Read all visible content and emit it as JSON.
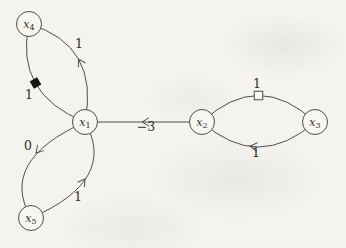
{
  "figure": {
    "background": "#f4f3ee",
    "stroke_color": "#4e4e4e",
    "text_color": "#332f2b",
    "node_fill": "#f7f6f1",
    "diamond_fill": "#181614",
    "node_radius": 12.5,
    "nodes": [
      {
        "name": "x1",
        "base": "x",
        "sub": "1",
        "x": 85,
        "y": 122
      },
      {
        "name": "x2",
        "base": "x",
        "sub": "2",
        "x": 202,
        "y": 122
      },
      {
        "name": "x3",
        "base": "x",
        "sub": "3",
        "x": 315,
        "y": 122
      },
      {
        "name": "x4",
        "base": "x",
        "sub": "4",
        "x": 29,
        "y": 24
      },
      {
        "name": "x5",
        "base": "x",
        "sub": "5",
        "x": 31,
        "y": 218
      }
    ],
    "edges": [
      {
        "name": "x1-to-x4",
        "path": "M 85 122 Q 100 45 29 24",
        "label": "1",
        "label_x": 79,
        "label_y": 48,
        "arrow": {
          "x": 78.5,
          "y": 59,
          "angle": -120
        }
      },
      {
        "name": "x4-to-x1",
        "path": "M 29 24 Q 14 94 85 122",
        "label": "1",
        "label_x": 29,
        "label_y": 99,
        "marker": {
          "type": "filled-diamond",
          "x": 35.5,
          "y": 83,
          "angle": 60
        }
      },
      {
        "name": "x1-to-x5",
        "path": "M 85 122 Q -2 161 31 218",
        "label": "0",
        "label_x": 28,
        "label_y": 150,
        "arrow": {
          "x": 36,
          "y": 153,
          "angle": 132
        }
      },
      {
        "name": "x5-to-x1",
        "path": "M 31 218 Q 118 180 85 122",
        "label": "1",
        "label_x": 78,
        "label_y": 201,
        "arrow": {
          "x": 85,
          "y": 179,
          "angle": -55
        }
      },
      {
        "name": "x2-to-x1",
        "path": "M 202 122 L 85 122",
        "label": "−3",
        "label_x": 146,
        "label_y": 131,
        "arrow": {
          "x": 142,
          "y": 122,
          "angle": 180
        }
      },
      {
        "name": "x2-to-x3-top",
        "path": "M 202 122 Q 258.5 69 315 122",
        "label": "1",
        "label_x": 257,
        "label_y": 88,
        "marker": {
          "type": "open-square",
          "x": 258.5,
          "y": 95.5,
          "angle": 0
        }
      },
      {
        "name": "x3-to-x2-bottom",
        "path": "M 315 122 Q 258 172 202 122",
        "label": "1",
        "label_x": 256,
        "label_y": 157,
        "arrow": {
          "x": 250,
          "y": 146,
          "angle": 187
        }
      }
    ]
  }
}
